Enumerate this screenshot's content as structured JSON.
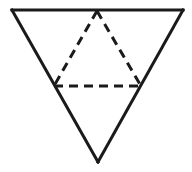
{
  "figure": {
    "background_color": "#ffffff",
    "stroke_color": "#1a1a1a",
    "canvas": {
      "width": 192,
      "height": 172
    },
    "outer_triangle": {
      "name": "outer-triangle",
      "orientation": "point-down",
      "line_style": "solid",
      "stroke_width": 3,
      "vertices": [
        {
          "label": "top-left",
          "x": 12,
          "y": 10
        },
        {
          "label": "top-right",
          "x": 183,
          "y": 10
        },
        {
          "label": "bottom",
          "x": 98,
          "y": 162
        }
      ],
      "edges": [
        {
          "name": "top-edge",
          "from": "top-left",
          "to": "top-right",
          "style": "solid"
        },
        {
          "name": "right-edge",
          "from": "top-right",
          "to": "bottom",
          "style": "solid"
        },
        {
          "name": "left-edge",
          "from": "bottom",
          "to": "top-left",
          "style": "solid"
        }
      ]
    },
    "inner_triangle": {
      "name": "inner-dashed-triangle",
      "orientation": "point-up",
      "line_style": "dashed",
      "stroke_width": 3,
      "dash_pattern": [
        9,
        6
      ],
      "vertices": [
        {
          "label": "apex",
          "x": 97,
          "y": 11
        },
        {
          "label": "bottom-left",
          "x": 54,
          "y": 86
        },
        {
          "label": "bottom-right",
          "x": 141,
          "y": 86
        }
      ],
      "edges": [
        {
          "name": "left-leg",
          "from": "apex",
          "to": "bottom-left",
          "style": "dashed"
        },
        {
          "name": "right-leg",
          "from": "apex",
          "to": "bottom-right",
          "style": "dashed"
        },
        {
          "name": "base",
          "from": "bottom-left",
          "to": "bottom-right",
          "style": "dashed"
        }
      ]
    }
  }
}
